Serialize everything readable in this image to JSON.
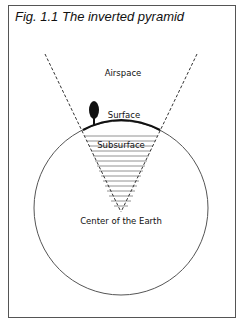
{
  "figure": {
    "title": "Fig. 1.1  The inverted pyramid",
    "labels": {
      "airspace": "Airspace",
      "surface": "Surface",
      "subsurface": "Subsurface",
      "center": "Center of the Earth"
    }
  }
}
